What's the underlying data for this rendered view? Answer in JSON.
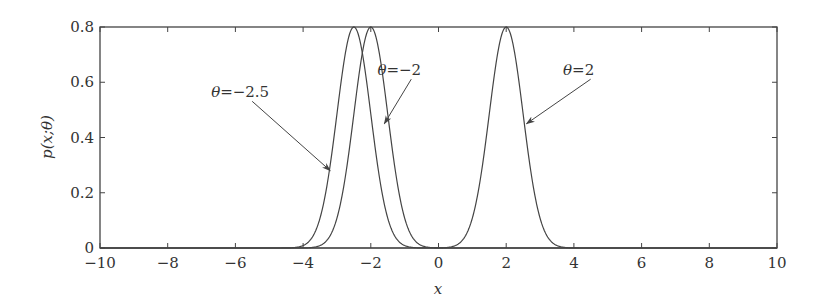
{
  "chart_data": {
    "type": "line",
    "title": "",
    "xlabel": "x",
    "ylabel": "p(x;θ)",
    "xlim": [
      -10,
      10
    ],
    "ylim": [
      0,
      0.8
    ],
    "x_ticks": [
      -10,
      -8,
      -6,
      -4,
      -2,
      0,
      2,
      4,
      6,
      8,
      10
    ],
    "x_tick_labels": [
      "−10",
      "−8",
      "−6",
      "−4",
      "−2",
      "0",
      "2",
      "4",
      "6",
      "8",
      "10"
    ],
    "y_ticks": [
      0,
      0.2,
      0.4,
      0.6,
      0.8
    ],
    "y_tick_labels": [
      "0",
      "0.2",
      "0.4",
      "0.6",
      "0.8"
    ],
    "grid": false,
    "legend": null,
    "sigma": 0.5,
    "series": [
      {
        "name": "θ = −2.5",
        "theta": -2.5,
        "peak": 0.8,
        "label": "θ = −2.5"
      },
      {
        "name": "θ = −2",
        "theta": -2,
        "peak": 0.8,
        "label": "θ = −2"
      },
      {
        "name": "θ = 2",
        "theta": 2,
        "peak": 0.8,
        "label": "θ = 2"
      }
    ],
    "annotations": [
      {
        "text": "θ = −2.5",
        "points_to_series": 0,
        "label_at": [
          -5.8,
          0.56
        ],
        "arrow_to": [
          -3.2,
          0.28
        ]
      },
      {
        "text": "θ = −2",
        "points_to_series": 1,
        "label_at": [
          -1.1,
          0.64
        ],
        "arrow_to": [
          -1.6,
          0.45
        ]
      },
      {
        "text": "θ = 2",
        "points_to_series": 2,
        "label_at": [
          4.2,
          0.64
        ],
        "arrow_to": [
          2.6,
          0.45
        ]
      }
    ]
  },
  "colors": {
    "line": "#444444",
    "axis": "#444444",
    "text": "#333333"
  }
}
